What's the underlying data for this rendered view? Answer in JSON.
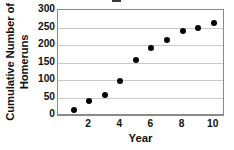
{
  "chart_data": {
    "type": "scatter",
    "title": "",
    "xlabel": "Year",
    "ylabel": "Cumulative Number of Homeruns",
    "ylabel_line1": "Cumulative Number of",
    "ylabel_line2": "Homeruns",
    "x": [
      1,
      2,
      3,
      4,
      5,
      6,
      7,
      8,
      9,
      10
    ],
    "values": [
      15,
      41,
      57,
      98,
      157,
      192,
      215,
      241,
      249,
      262
    ],
    "series": [
      {
        "name": "Cumulative Homeruns",
        "values": [
          15,
          41,
          57,
          98,
          157,
          192,
          215,
          241,
          249,
          262
        ]
      }
    ],
    "xlim": [
      0,
      10.6
    ],
    "ylim": [
      0,
      300
    ],
    "yticks": [
      0,
      50,
      100,
      150,
      200,
      250,
      300
    ],
    "ytick_labels": [
      "0",
      "50",
      "100",
      "150",
      "200",
      "250",
      "300"
    ],
    "xticks": [
      2,
      4,
      6,
      8,
      10
    ],
    "xtick_labels": [
      "2",
      "4",
      "6",
      "8",
      "10"
    ],
    "grid": "horizontal",
    "legend": "none",
    "marker": "filled-circle",
    "colors": {
      "marker": "#000000",
      "gridline": "#c9c9c9",
      "frame": "#8a8a8a",
      "background": "#ffffff",
      "text": "#111111"
    }
  }
}
